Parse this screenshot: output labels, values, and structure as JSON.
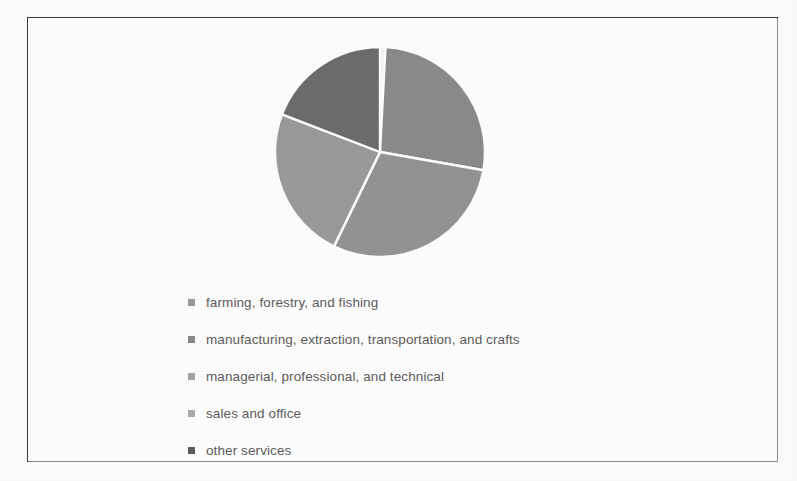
{
  "chart_data": {
    "type": "pie",
    "title": "",
    "categories": [
      "farming, forestry, and fishing",
      "manufacturing, extraction, transportation, and crafts",
      "managerial, professional, and technical",
      "sales and office",
      "other services"
    ],
    "values": [
      1,
      27,
      29,
      24,
      19
    ],
    "units": "percent of workers",
    "start_angle_deg": 0,
    "direction": "clockwise",
    "legend_position": "below",
    "grid": false,
    "slice_colors": [
      "#f2f2f2",
      "#8b8b8b",
      "#949494",
      "#9b9b9b",
      "#6d6d6d"
    ],
    "slice_separator_color": "#ffffff",
    "slices": [
      {
        "label": "farming, forestry, and fishing",
        "value": 1,
        "color": "#f2f2f2",
        "start_deg": 0,
        "end_deg": 3
      },
      {
        "label": "manufacturing, extraction, transportation, and crafts",
        "value": 27,
        "color": "#8b8b8b",
        "start_deg": 3,
        "end_deg": 100
      },
      {
        "label": "managerial, professional, and technical",
        "value": 29,
        "color": "#949494",
        "start_deg": 100,
        "end_deg": 206
      },
      {
        "label": "sales and office",
        "value": 24,
        "color": "#9b9b9b",
        "start_deg": 206,
        "end_deg": 291
      },
      {
        "label": "other services",
        "value": 19,
        "color": "#6d6d6d",
        "start_deg": 291,
        "end_deg": 360
      }
    ]
  },
  "legend": {
    "items": [
      {
        "label": "farming, forestry, and fishing",
        "marker_color": "#9a9a9a"
      },
      {
        "label": "manufacturing, extraction, transportation, and crafts",
        "marker_color": "#8a8a8a"
      },
      {
        "label": "managerial, professional, and technical",
        "marker_color": "#a4a4a4"
      },
      {
        "label": "sales and office",
        "marker_color": "#ababab"
      },
      {
        "label": "other services",
        "marker_color": "#5e5e5e"
      }
    ]
  },
  "frame": {
    "border_color": "#3c3c3c",
    "background": "#ffffff"
  }
}
